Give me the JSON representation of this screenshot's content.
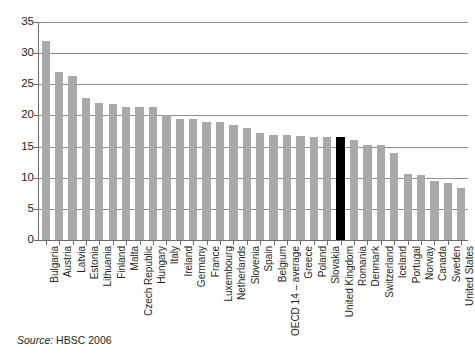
{
  "chart_data": {
    "type": "bar",
    "title": "",
    "xlabel": "",
    "ylabel": "",
    "ylim": [
      0,
      35
    ],
    "ytick_step": 5,
    "yticks": [
      0,
      5,
      10,
      15,
      20,
      25,
      30,
      35
    ],
    "grid": true,
    "legend": null,
    "highlight_category": "United Kingdom",
    "highlight_color": "#000000",
    "bar_color": "#a9a9a9",
    "categories": [
      "Bulgaria",
      "Austria",
      "Latvia",
      "Estonia",
      "Lithuania",
      "Finland",
      "Malta",
      "Czech Republic",
      "Hungary",
      "Italy",
      "Ireland",
      "Germany",
      "France",
      "Luxembourg",
      "Netherlands",
      "Slovenia",
      "Spain",
      "Belgium",
      "OECD 14 – average",
      "Greece",
      "Poland",
      "Slovakia",
      "United Kingdom",
      "Romania",
      "Denmark",
      "Switzerland",
      "Iceland",
      "Portugal",
      "Norway",
      "Canada",
      "Sweden",
      "United States"
    ],
    "values": [
      32.0,
      27.0,
      26.3,
      22.8,
      22.0,
      21.8,
      21.4,
      21.3,
      21.4,
      20.0,
      19.5,
      19.5,
      19.0,
      19.0,
      18.5,
      18.0,
      17.2,
      16.9,
      16.8,
      16.7,
      16.6,
      16.6,
      16.5,
      16.1,
      15.3,
      15.2,
      14.0,
      10.6,
      10.4,
      9.5,
      9.2,
      8.4
    ]
  },
  "source": {
    "label": "Source:",
    "value": "HBSC 2006"
  }
}
